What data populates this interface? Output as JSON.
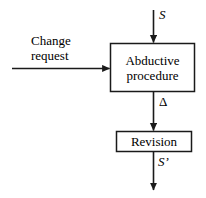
{
  "diagram": {
    "background_color": "#ffffff",
    "stroke_color": "#1a1a1a",
    "text_color": "#000000",
    "nodes": [
      {
        "id": "abductive-procedure",
        "label": "Abductive\nprocedure",
        "shape": "rectangle"
      },
      {
        "id": "revision",
        "label": "Revision",
        "shape": "rectangle"
      }
    ],
    "edges": [
      {
        "id": "input-s",
        "label": "S",
        "from": "external-input",
        "to": "abductive-procedure",
        "direction": "down",
        "style": "italic"
      },
      {
        "id": "change-request",
        "label": "Change\nrequest",
        "from": "external-input",
        "to": "abductive-procedure",
        "direction": "right",
        "style": "upright"
      },
      {
        "id": "delta",
        "label": "Δ",
        "from": "abductive-procedure",
        "to": "revision",
        "direction": "down",
        "style": "upright"
      },
      {
        "id": "output-s-prime",
        "label": "S’",
        "from": "revision",
        "to": "external-output",
        "direction": "down",
        "style": "italic"
      }
    ]
  }
}
